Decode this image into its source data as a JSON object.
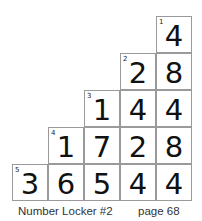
{
  "puzzle": {
    "name": "Number Locker #2",
    "page": "page 68",
    "rows": [
      {
        "clue": "1",
        "cells": [
          "4"
        ]
      },
      {
        "clue": "2",
        "cells": [
          "2",
          "8"
        ]
      },
      {
        "clue": "3",
        "cells": [
          "1",
          "4",
          "4"
        ]
      },
      {
        "clue": "4",
        "cells": [
          "1",
          "7",
          "2",
          "8"
        ]
      },
      {
        "clue": "5",
        "cells": [
          "3",
          "6",
          "5",
          "4",
          "4"
        ]
      }
    ]
  }
}
